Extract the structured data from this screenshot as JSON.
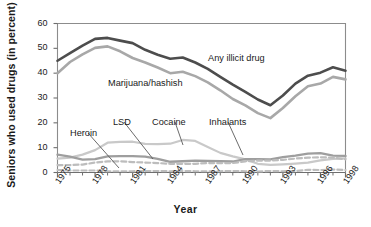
{
  "chart_data": {
    "type": "line",
    "title": "",
    "xlabel": "Year",
    "ylabel": "Seniors who used drugs (in percent)",
    "xlim": [
      1975,
      1998
    ],
    "ylim": [
      0,
      60
    ],
    "yticks": [
      0,
      10,
      20,
      30,
      40,
      50,
      60
    ],
    "xticks": [
      1975,
      1978,
      1981,
      1984,
      1987,
      1990,
      1993,
      1996,
      1998
    ],
    "xtick_labels": [
      "1975",
      "1978",
      "1981",
      "1984",
      "1987",
      "1990",
      "1993",
      "1996",
      "1998"
    ],
    "ytick_labels": [
      "0",
      "10",
      "20",
      "30",
      "40",
      "50",
      "60"
    ],
    "grid": false,
    "legend": "inline-annotations",
    "x": [
      1975,
      1976,
      1977,
      1978,
      1979,
      1980,
      1981,
      1982,
      1983,
      1984,
      1985,
      1986,
      1987,
      1988,
      1989,
      1990,
      1991,
      1992,
      1993,
      1994,
      1995,
      1996,
      1997,
      1998
    ],
    "series": [
      {
        "name": "Any illicit drug",
        "color": "#4d4d4d",
        "style": "solid",
        "width": 2.6,
        "values": [
          45.0,
          48.1,
          51.1,
          53.8,
          54.2,
          53.1,
          52.1,
          49.4,
          47.4,
          45.8,
          46.3,
          44.3,
          41.7,
          38.5,
          35.4,
          32.5,
          29.4,
          27.1,
          31.0,
          35.8,
          39.0,
          40.2,
          42.4,
          41.0
        ]
      },
      {
        "name": "Marijuana/hashish",
        "color": "#a8a8a8",
        "style": "solid",
        "width": 2.6,
        "values": [
          40.0,
          44.5,
          47.6,
          50.2,
          50.8,
          48.8,
          46.1,
          44.3,
          42.3,
          40.0,
          40.6,
          38.8,
          36.3,
          33.1,
          29.6,
          27.0,
          23.9,
          21.9,
          26.0,
          30.7,
          34.7,
          35.8,
          38.5,
          37.5
        ]
      },
      {
        "name": "Cocaine",
        "color": "#c9c9c9",
        "style": "solid",
        "width": 2.2,
        "values": [
          5.6,
          6.0,
          7.2,
          9.0,
          12.0,
          12.3,
          12.4,
          11.5,
          11.4,
          11.6,
          13.1,
          12.7,
          10.3,
          7.9,
          6.5,
          5.3,
          3.5,
          3.1,
          3.3,
          3.6,
          4.0,
          4.9,
          5.5,
          5.7
        ]
      },
      {
        "name": "Inhalants",
        "color": "#9e9e9e",
        "style": "solid",
        "width": 2.4,
        "values": [
          7.2,
          6.4,
          5.2,
          5.4,
          6.5,
          6.6,
          6.6,
          6.4,
          5.5,
          4.3,
          4.5,
          4.8,
          4.7,
          4.6,
          4.4,
          5.4,
          5.4,
          5.3,
          6.2,
          6.8,
          7.6,
          7.8,
          6.8,
          6.7
        ]
      },
      {
        "name": "LSD",
        "color": "#bdbdbd",
        "style": "dashed",
        "width": 2.2,
        "values": [
          3.0,
          3.0,
          3.2,
          4.0,
          4.5,
          4.5,
          4.2,
          4.0,
          3.8,
          3.5,
          3.5,
          3.5,
          3.8,
          3.8,
          3.8,
          4.5,
          4.8,
          4.8,
          5.1,
          5.6,
          6.0,
          6.1,
          6.0,
          5.3
        ]
      },
      {
        "name": "Heroin",
        "color": "#bdbdbd",
        "style": "dashed",
        "width": 2.2,
        "values": [
          1.0,
          0.8,
          0.8,
          0.8,
          0.5,
          0.5,
          0.5,
          0.6,
          0.6,
          0.5,
          0.6,
          0.5,
          0.5,
          0.5,
          0.6,
          0.5,
          0.4,
          0.6,
          0.5,
          0.6,
          1.1,
          1.0,
          1.2,
          1.0
        ]
      }
    ],
    "annotations": [
      {
        "text": "Any illicit drug",
        "x_px": 208,
        "y_px": 53,
        "leader": null
      },
      {
        "text": "Marijuana/hashish",
        "x_px": 108,
        "y_px": 78,
        "leader": null
      },
      {
        "text": "Heroin",
        "x_px": 70,
        "y_px": 128,
        "leader": {
          "x1": 88,
          "y1": 133,
          "x2": 119,
          "y2": 168
        }
      },
      {
        "text": "LSD",
        "x_px": 113,
        "y_px": 117,
        "leader": {
          "x1": 124,
          "y1": 122,
          "x2": 153,
          "y2": 159
        }
      },
      {
        "text": "Cocaine",
        "x_px": 152,
        "y_px": 117,
        "leader": {
          "x1": 175,
          "y1": 122,
          "x2": 183,
          "y2": 145
        }
      },
      {
        "text": "Inhalants",
        "x_px": 209,
        "y_px": 117,
        "leader": {
          "x1": 228,
          "y1": 122,
          "x2": 243,
          "y2": 155
        }
      }
    ]
  },
  "colors": {
    "axis": "#6e6e6e",
    "text": "#1a1a1a",
    "background": "#ffffff",
    "frame": "#8c8c8c"
  }
}
